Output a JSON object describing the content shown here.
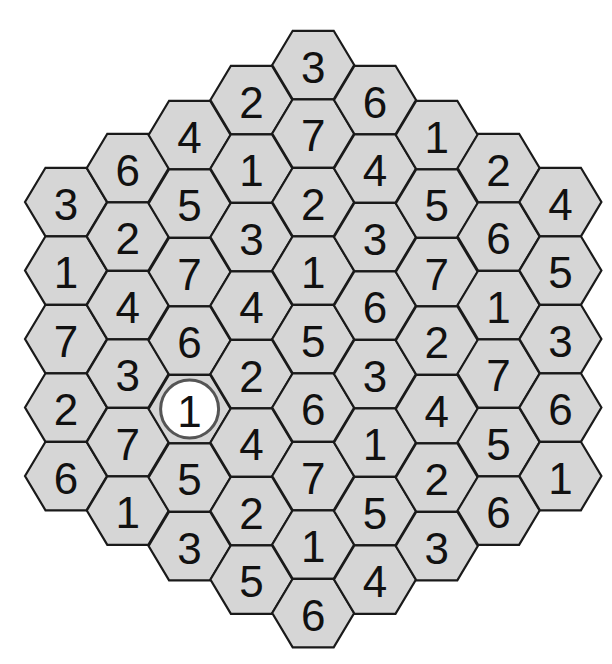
{
  "puzzle": {
    "type": "hexagonal-number-grid",
    "title_partial": "",
    "colors": {
      "cell_fill": "#d6d6d6",
      "cell_stroke": "#1a1a1a",
      "digit": "#111111",
      "given_circle_fill": "#ffffff",
      "given_circle_stroke": "#555555"
    },
    "geometry": {
      "origin_x": 66,
      "col_spacing": 61.8,
      "row_spacing": 68.5,
      "hex_radius": 41,
      "board_center_y": 339
    },
    "columns": [
      {
        "index": 0,
        "first_y": 202,
        "values": [
          3,
          1,
          7,
          2,
          6
        ]
      },
      {
        "index": 1,
        "first_y": 168,
        "values": [
          6,
          2,
          4,
          3,
          7,
          1
        ]
      },
      {
        "index": 2,
        "first_y": 135,
        "values": [
          4,
          5,
          7,
          6,
          1,
          5,
          3
        ]
      },
      {
        "index": 3,
        "first_y": 100,
        "values": [
          2,
          1,
          3,
          4,
          2,
          4,
          2,
          5
        ]
      },
      {
        "index": 4,
        "first_y": 65,
        "values": [
          3,
          7,
          2,
          1,
          5,
          6,
          7,
          1,
          6
        ]
      },
      {
        "index": 5,
        "first_y": 100,
        "values": [
          6,
          4,
          3,
          6,
          3,
          1,
          5,
          4
        ]
      },
      {
        "index": 6,
        "first_y": 135,
        "values": [
          1,
          5,
          7,
          2,
          4,
          2,
          3
        ]
      },
      {
        "index": 7,
        "first_y": 168,
        "values": [
          2,
          6,
          1,
          7,
          5,
          6
        ]
      },
      {
        "index": 8,
        "first_y": 202,
        "values": [
          4,
          5,
          3,
          6,
          1
        ]
      }
    ],
    "circled_cells": [
      {
        "col": 2,
        "row": 4,
        "value": 1
      }
    ]
  }
}
